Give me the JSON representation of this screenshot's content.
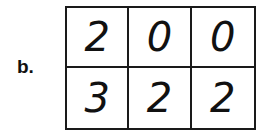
{
  "label": "b.",
  "grid": {
    "rows": [
      [
        "2",
        "0",
        "0"
      ],
      [
        "3",
        "2",
        "2"
      ]
    ]
  }
}
